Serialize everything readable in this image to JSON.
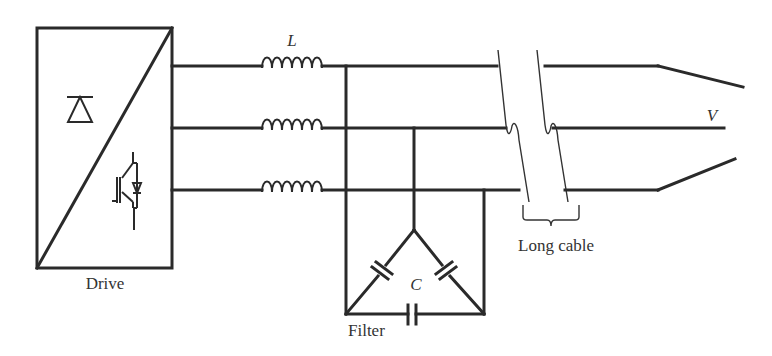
{
  "diagram": {
    "type": "circuit-schematic",
    "labels": {
      "drive": "Drive",
      "inductor": "L",
      "capacitor": "C",
      "filter": "Filter",
      "voltage": "V",
      "long_cable": "Long cable"
    },
    "components": [
      {
        "name": "drive",
        "kind": "converter-block",
        "contains": [
          "diode-rectifier-symbol",
          "igbt-with-antiparallel-diode-symbol"
        ]
      },
      {
        "name": "line-inductors",
        "kind": "inductor",
        "count": 3,
        "label": "L"
      },
      {
        "name": "filter",
        "kind": "delta-capacitor-filter",
        "count": 3,
        "label": "C"
      },
      {
        "name": "long-cable",
        "kind": "cable-break",
        "phases": 3
      },
      {
        "name": "motor-terminals",
        "kind": "output-lines",
        "label": "V"
      }
    ],
    "colors": {
      "line": "#2a2a2a",
      "text": "#333333",
      "background": "#ffffff"
    }
  }
}
